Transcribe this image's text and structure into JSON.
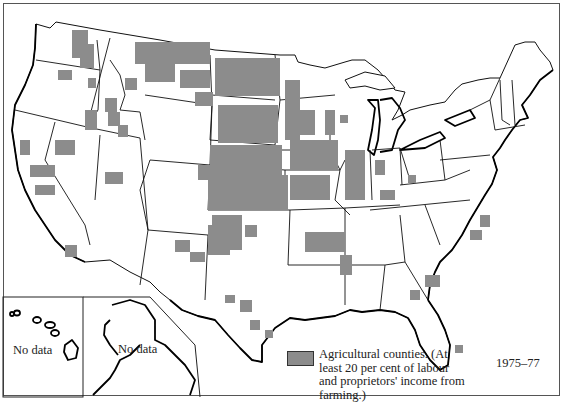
{
  "map": {
    "title": "Agricultural counties of the United States",
    "period": "1975–77",
    "legend": {
      "swatch_color": "#8c8c8c",
      "label": "Agricultural counties. (At least 20 per cent of labour and proprietors' income from farming.)"
    },
    "insets": {
      "hawaii_label": "No data",
      "alaska_label": "No data"
    },
    "colors": {
      "agricultural": "#8c8c8c",
      "land": "#ffffff",
      "border": "#111111"
    },
    "regions_with_high_agricultural_density": [
      "Montana",
      "North Dakota",
      "South Dakota",
      "Nebraska",
      "Kansas",
      "Iowa",
      "Minnesota",
      "Oklahoma",
      "Texas Panhandle",
      "Eastern Washington",
      "Idaho",
      "Missouri",
      "Illinois",
      "Arkansas",
      "Mississippi Delta"
    ]
  }
}
